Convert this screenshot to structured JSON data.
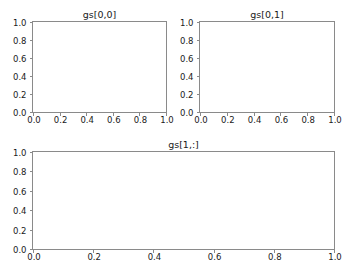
{
  "figure": {
    "width": 351,
    "height": 271,
    "facecolor": "#ffffff",
    "spine_color": "#8a8a8a",
    "text_color": "#1a1a1a"
  },
  "chart_data": [
    {
      "type": "line",
      "title": "gs[0,0]",
      "xlabel": "",
      "ylabel": "",
      "xlim": [
        0.0,
        1.0
      ],
      "ylim": [
        0.0,
        1.0
      ],
      "xticks": [
        "0.0",
        "0.2",
        "0.4",
        "0.6",
        "0.8",
        "1.0"
      ],
      "yticks": [
        "0.0",
        "0.2",
        "0.4",
        "0.6",
        "0.8",
        "1.0"
      ],
      "xtick_values": [
        0.0,
        0.2,
        0.4,
        0.6,
        0.8,
        1.0
      ],
      "ytick_values": [
        0.0,
        0.2,
        0.4,
        0.6,
        0.8,
        1.0
      ],
      "grid": false,
      "legend": null,
      "series": []
    },
    {
      "type": "line",
      "title": "gs[0,1]",
      "xlabel": "",
      "ylabel": "",
      "xlim": [
        0.0,
        1.0
      ],
      "ylim": [
        0.0,
        1.0
      ],
      "xticks": [
        "0.0",
        "0.2",
        "0.4",
        "0.6",
        "0.8",
        "1.0"
      ],
      "yticks": [
        "0.0",
        "0.2",
        "0.4",
        "0.6",
        "0.8",
        "1.0"
      ],
      "xtick_values": [
        0.0,
        0.2,
        0.4,
        0.6,
        0.8,
        1.0
      ],
      "ytick_values": [
        0.0,
        0.2,
        0.4,
        0.6,
        0.8,
        1.0
      ],
      "grid": false,
      "legend": null,
      "series": []
    },
    {
      "type": "line",
      "title": "gs[1,:]",
      "xlabel": "",
      "ylabel": "",
      "xlim": [
        0.0,
        1.0
      ],
      "ylim": [
        0.0,
        1.0
      ],
      "xticks": [
        "0.0",
        "0.2",
        "0.4",
        "0.6",
        "0.8",
        "1.0"
      ],
      "yticks": [
        "0.0",
        "0.2",
        "0.4",
        "0.6",
        "0.8",
        "1.0"
      ],
      "xtick_values": [
        0.0,
        0.2,
        0.4,
        0.6,
        0.8,
        1.0
      ],
      "ytick_values": [
        0.0,
        0.2,
        0.4,
        0.6,
        0.8,
        1.0
      ],
      "grid": false,
      "legend": null,
      "series": []
    }
  ]
}
